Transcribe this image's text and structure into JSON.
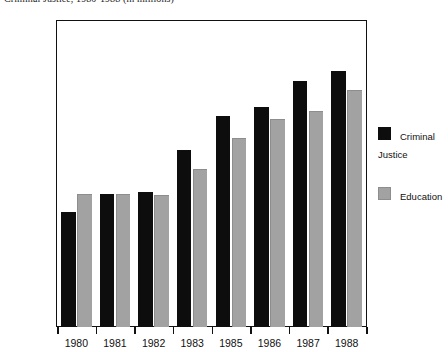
{
  "chart_data": {
    "type": "bar",
    "title": "Criminal Justice, 1980-1988 (in millions)",
    "xlabel": "",
    "ylabel": "",
    "ylim": [
      0,
      20000
    ],
    "y_major_ticks": [
      0,
      5000,
      10000,
      15000,
      20000
    ],
    "y_major_tick_labels": [
      "0",
      "5000",
      "10000",
      "15000",
      "20000"
    ],
    "y_minor_ticks": [
      2500,
      7500,
      12500,
      17500
    ],
    "grid": false,
    "legend_position": "right",
    "categories": [
      "1980",
      "1981",
      "1982",
      "1983",
      "1985",
      "1986",
      "1987",
      "1988"
    ],
    "series": [
      {
        "name": "Criminal Justice",
        "color": "#0d0d0d",
        "values": [
          7500,
          8700,
          8800,
          11600,
          13800,
          14400,
          16100,
          16750
        ]
      },
      {
        "name": "Education",
        "color": "#a2a2a2",
        "values": [
          8700,
          8700,
          8600,
          10300,
          12350,
          13600,
          14100,
          15500
        ]
      }
    ]
  },
  "legend": {
    "items": [
      {
        "label": "Criminal\nJustice",
        "swatch": "black-swatch-icon"
      },
      {
        "label": "Education",
        "swatch": "gray-swatch-icon"
      }
    ]
  }
}
